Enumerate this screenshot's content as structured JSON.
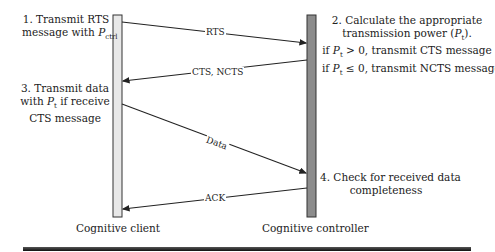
{
  "entities": {
    "client": {
      "label": "Cognitive client",
      "bar_color": "#e8e8e8"
    },
    "controller": {
      "label": "Cognitive controller",
      "bar_color": "#8c8c8c"
    }
  },
  "steps": {
    "step1": {
      "line1": "1. Transmit RTS",
      "line2_prefix": "message with ",
      "line2_var": "P",
      "line2_sub": "ctrl"
    },
    "step2": {
      "line1": "2. Calculate the appropriate",
      "line2_prefix": "transmission power (",
      "line2_var": "P",
      "line2_sub": "t",
      "line2_suffix": ").",
      "line3_prefix": "if ",
      "line3_var": "P",
      "line3_sub": "t",
      "line3_suffix": " > 0, transmit CTS message",
      "line4_prefix": "if ",
      "line4_var": "P",
      "line4_sub": "t",
      "line4_suffix": " ≤ 0, transmit NCTS message"
    },
    "step3": {
      "line1": "3. Transmit data",
      "line2_prefix": "with ",
      "line2_var": "P",
      "line2_sub": "t",
      "line2_suffix": " if receive",
      "line3": "CTS message"
    },
    "step4": {
      "line1": "4. Check for received data",
      "line2": "completeness"
    }
  },
  "messages": [
    {
      "label": "RTS",
      "from": "client",
      "to": "controller"
    },
    {
      "label": "CTS, NCTS",
      "from": "controller",
      "to": "client"
    },
    {
      "label": "Data",
      "from": "client",
      "to": "controller"
    },
    {
      "label": "ACK",
      "from": "controller",
      "to": "client"
    }
  ]
}
